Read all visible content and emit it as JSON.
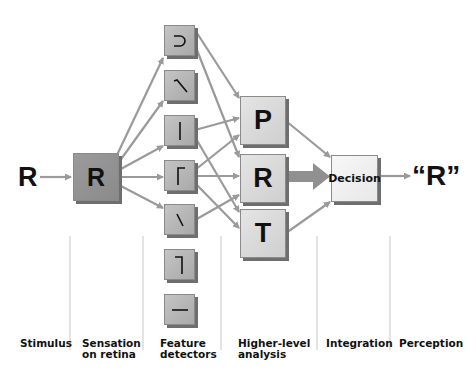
{
  "stimulus_letter": "R",
  "retina_letter": "R",
  "feature_detectors": [
    {
      "name": "curve",
      "glyph": "curve"
    },
    {
      "name": "diagonal-down",
      "glyph": "diag1"
    },
    {
      "name": "vertical",
      "glyph": "vert"
    },
    {
      "name": "corner-top-left",
      "glyph": "cornerTL"
    },
    {
      "name": "diagonal-short",
      "glyph": "diag2"
    },
    {
      "name": "corner-top-right",
      "glyph": "cornerTR"
    },
    {
      "name": "horizontal",
      "glyph": "horiz"
    }
  ],
  "higher_level": [
    "P",
    "R",
    "T"
  ],
  "integration_label": "Decision",
  "perception_output": "“R”",
  "stages": [
    {
      "line1": "Stimulus",
      "line2": ""
    },
    {
      "line1": "Sensation",
      "line2": "on retina"
    },
    {
      "line1": "Feature",
      "line2": "detectors"
    },
    {
      "line1": "Higher-level",
      "line2": "analysis"
    },
    {
      "line1": "Integration",
      "line2": ""
    },
    {
      "line1": "Perception",
      "line2": ""
    }
  ],
  "colors": {
    "arrow": "#9a9a9a",
    "divider": "#c8c8c8"
  }
}
